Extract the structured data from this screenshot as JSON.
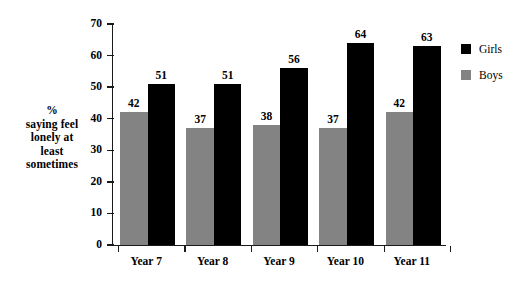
{
  "chart_data": {
    "type": "bar",
    "title": "",
    "subtitle": "",
    "xlabel": "",
    "ylabel": "% saying feel lonely at least sometimes",
    "ylabel_lines": [
      "%",
      "saying feel",
      "lonely at",
      "least",
      "sometimes"
    ],
    "categories": [
      "Year 7",
      "Year 8",
      "Year 9",
      "Year 10",
      "Year 11"
    ],
    "series": [
      {
        "name": "Boys",
        "color": "#838383",
        "values": [
          42,
          37,
          38,
          37,
          42
        ]
      },
      {
        "name": "Girls",
        "color": "#000000",
        "values": [
          51,
          51,
          56,
          64,
          63
        ]
      }
    ],
    "ylim": [
      0,
      70
    ],
    "ytick_values": [
      0,
      10,
      20,
      30,
      40,
      50,
      60,
      70
    ],
    "ytick_labels": [
      "0",
      "10",
      "20",
      "30",
      "40",
      "50",
      "60",
      "70"
    ],
    "grid": false,
    "data_labels": true,
    "legend": {
      "position": "right-top",
      "entries": [
        {
          "label": "Girls",
          "color": "#000000"
        },
        {
          "label": "Boys",
          "color": "#838383"
        }
      ]
    }
  }
}
